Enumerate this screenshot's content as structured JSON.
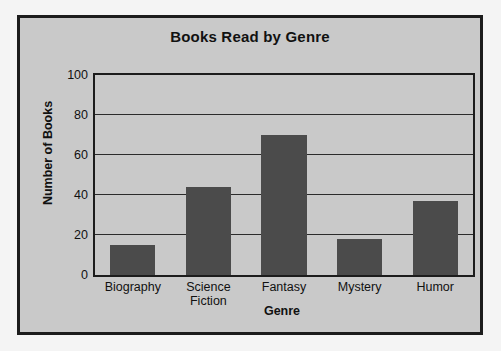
{
  "chart_data": {
    "type": "bar",
    "title": "Books Read by Genre",
    "xlabel": "Genre",
    "ylabel": "Number of Books",
    "categories": [
      "Biography",
      "Science\nFiction",
      "Fantasy",
      "Mystery",
      "Humor"
    ],
    "values": [
      15,
      44,
      70,
      18,
      37
    ],
    "ylim": [
      0,
      100
    ],
    "yticks": [
      0,
      20,
      40,
      60,
      80,
      100
    ],
    "ytick_labels": [
      "0",
      "20",
      "40",
      "60",
      "80",
      "100"
    ],
    "grid": true,
    "legend": null,
    "colors": {
      "bar_fill": "#4b4b4b",
      "plot_background": "#c9c9c9",
      "panel_border": "#1c1c1c",
      "figure_background": "#f4f4f4",
      "axis_line": "#1c1c1c",
      "gridline": "#2b2b2b",
      "text": "#111111"
    }
  }
}
